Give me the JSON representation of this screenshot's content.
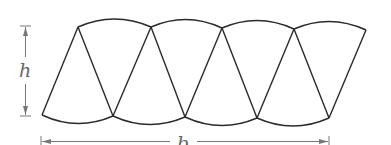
{
  "figure": {
    "sector_count": 8,
    "sectors_pointing_up": 4,
    "sectors_pointing_down": 4
  },
  "labels": {
    "height": "h",
    "base": "b"
  },
  "colors": {
    "stroke": "#2a2a2a",
    "dimension": "#777777",
    "label": "#666666"
  }
}
